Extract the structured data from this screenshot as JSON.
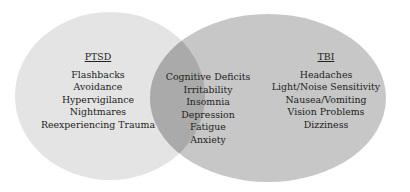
{
  "diagram": {
    "type": "venn",
    "colors": {
      "left_fill": "#e4e4e4",
      "right_fill": "#c7c7c7",
      "overlap_fill": "#aaaaaa",
      "text": "#222222",
      "background": "#ffffff"
    },
    "sets": [
      {
        "name": "PTSD",
        "items": [
          "Flashbacks",
          "Avoidance",
          "Hypervigilance",
          "Nightmares",
          "Reexperiencing Trauma"
        ]
      },
      {
        "name": "TBI",
        "items": [
          "Headaches",
          "Light/Noise Sensitivity",
          "Nausea/Vomiting",
          "Vision Problems",
          "Dizziness"
        ]
      }
    ],
    "intersection": {
      "items": [
        "Cognitive Deficits",
        "Irritability",
        "Insomnia",
        "Depression",
        "Fatigue",
        "Anxiety"
      ]
    }
  }
}
